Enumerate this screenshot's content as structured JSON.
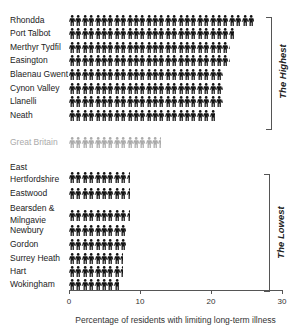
{
  "chart_data": {
    "type": "bar",
    "style": "isotype pictogram (person icons)",
    "title": "",
    "xlabel": "Percentage of residents with limiting long-term illness",
    "ylabel": "",
    "xlim": [
      0,
      30
    ],
    "xticks": [
      "0",
      "10",
      "20",
      "30"
    ],
    "grid": false,
    "legend": null,
    "categories": [
      "Rhondda",
      "Port Talbot",
      "Merthyr Tydfil",
      "Easington",
      "Blaenau Gwent",
      "Cynon Valley",
      "Llanelli",
      "Neath",
      "Great Britain",
      "East Hertfordshire",
      "Eastwood",
      "Bearsden & Milngavie",
      "Newbury",
      "Gordon",
      "Surrey Heath",
      "Hart",
      "Wokingham"
    ],
    "values": [
      26,
      23.2,
      22.7,
      22.7,
      21.7,
      21.7,
      21.7,
      20.6,
      12.9,
      8.6,
      8.6,
      8.6,
      8.0,
      8.0,
      7.6,
      7.6,
      7.0
    ],
    "groups": [
      {
        "name": "The Highest",
        "members": [
          "Rhondda",
          "Port Talbot",
          "Merthyr Tydfil",
          "Easington",
          "Blaenau Gwent",
          "Cynon Valley",
          "Llanelli",
          "Neath"
        ]
      },
      {
        "name": "Reference",
        "members": [
          "Great Britain"
        ]
      },
      {
        "name": "The Lowest",
        "members": [
          "East Hertfordshire",
          "Eastwood",
          "Bearsden & Milngavie",
          "Newbury",
          "Gordon",
          "Surrey Heath",
          "Hart",
          "Wokingham"
        ]
      }
    ],
    "colors": {
      "regions": "#111111",
      "reference": "#aaaaaa"
    }
  },
  "rows": [
    {
      "label": "Rhondda",
      "value": 26,
      "y": 15,
      "bar_y": 15,
      "ref": false
    },
    {
      "label": "Port Talbot",
      "value": 23.2,
      "y": 28,
      "bar_y": 28,
      "ref": false
    },
    {
      "label": "Merthyr Tydfil",
      "value": 22.7,
      "y": 42,
      "bar_y": 42,
      "ref": false
    },
    {
      "label": "Easington",
      "value": 22.7,
      "y": 55,
      "bar_y": 55,
      "ref": false
    },
    {
      "label": "Blaenau Gwent",
      "value": 21.7,
      "y": 69,
      "bar_y": 69,
      "ref": false
    },
    {
      "label": "Cynon Valley",
      "value": 21.7,
      "y": 83,
      "bar_y": 83,
      "ref": false
    },
    {
      "label": "Llanelli",
      "value": 21.7,
      "y": 96,
      "bar_y": 96,
      "ref": false
    },
    {
      "label": "Neath",
      "value": 20.6,
      "y": 110,
      "bar_y": 110,
      "ref": false
    },
    {
      "label": "Great Britain",
      "value": 12.9,
      "y": 137,
      "bar_y": 137,
      "ref": true
    },
    {
      "label": "East\nHertfordshire",
      "value": 8.6,
      "y": 162,
      "bar_y": 172,
      "ref": false
    },
    {
      "label": "Eastwood",
      "value": 8.6,
      "y": 188,
      "bar_y": 188,
      "ref": false
    },
    {
      "label": "Bearsden &\nMilngavie",
      "value": 8.6,
      "y": 203,
      "bar_y": 210,
      "ref": false
    },
    {
      "label": "Newbury",
      "value": 8.0,
      "y": 225,
      "bar_y": 225,
      "ref": false
    },
    {
      "label": "Gordon",
      "value": 8.0,
      "y": 239,
      "bar_y": 239,
      "ref": false
    },
    {
      "label": "Surrey Heath",
      "value": 7.6,
      "y": 253,
      "bar_y": 253,
      "ref": false
    },
    {
      "label": "Hart",
      "value": 7.6,
      "y": 266,
      "bar_y": 266,
      "ref": false
    },
    {
      "label": "Wokingham",
      "value": 7.0,
      "y": 279,
      "bar_y": 279,
      "ref": false
    }
  ],
  "brackets": {
    "highest": {
      "label": "The Highest"
    },
    "lowest": {
      "label": "The Lowest"
    }
  },
  "axis": {
    "ticks": [
      "0",
      "10",
      "20",
      "30"
    ],
    "label": "Percentage of residents with limiting long-term illness"
  }
}
